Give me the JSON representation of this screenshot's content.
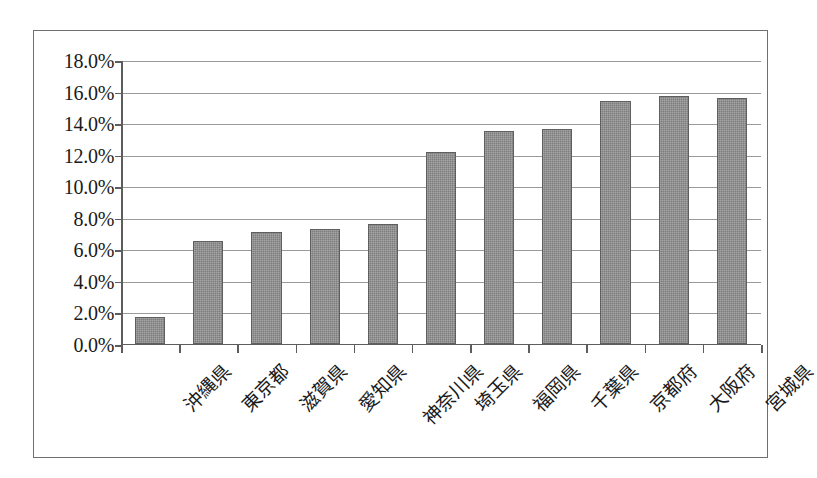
{
  "chart_data": {
    "type": "bar",
    "title": "",
    "subtitle": "",
    "xlabel": "",
    "ylabel": "",
    "categories": [
      "沖縄県",
      "東京都",
      "滋賀県",
      "愛知県",
      "神奈川県",
      "埼玉県",
      "福岡県",
      "千葉県",
      "京都府",
      "大阪府",
      "宮城県"
    ],
    "values": [
      1.7,
      6.5,
      7.1,
      7.3,
      7.6,
      12.2,
      13.5,
      13.6,
      15.4,
      15.7,
      15.6
    ],
    "value_labels": [
      "1.7%",
      "6.5%",
      "7.1%",
      "7.3%",
      "7.6%",
      "12.2%",
      "13.5%",
      "13.6%",
      "15.4%",
      "15.7%",
      "15.6%"
    ],
    "ylim": [
      0.0,
      18.0
    ],
    "ytick_values": [
      0.0,
      2.0,
      4.0,
      6.0,
      8.0,
      10.0,
      12.0,
      14.0,
      16.0,
      18.0
    ],
    "ytick_labels": [
      "0.0%",
      "2.0%",
      "4.0%",
      "6.0%",
      "8.0%",
      "10.0%",
      "12.0%",
      "14.0%",
      "16.0%",
      "18.0%"
    ],
    "grid": true,
    "legend": false,
    "legend_position": "none",
    "series_name": "",
    "bar_color": "#7d7d7d",
    "grid_color": "#9a9a9a",
    "axis_color": "#5d5d5d",
    "frame_color": "#6f6f6f",
    "background_color": "#ffffff",
    "xtick_label_rotation": -45
  }
}
